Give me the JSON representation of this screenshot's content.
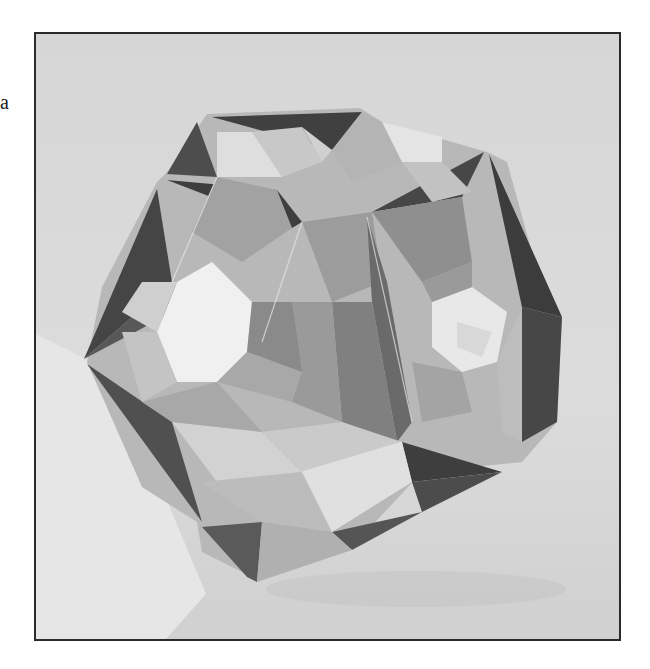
{
  "image": {
    "description": "Black-and-white photograph of a modular origami polyhedron (stellated, with open hexagonal/pentagonal windows) resting on a plain surface, enclosed in a thin dark rectangular frame",
    "stray_text": "a",
    "subject": "origami polyhedron",
    "colors": {
      "background_page": "#ffffff",
      "frame_border": "#2b2b2b",
      "photo_background": "#d4d4d4",
      "dark_facet": "#4a4a4a",
      "mid_facet": "#9a9a9a",
      "light_facet": "#dcdcdc",
      "window_highlight": "#f2f2f2"
    }
  }
}
